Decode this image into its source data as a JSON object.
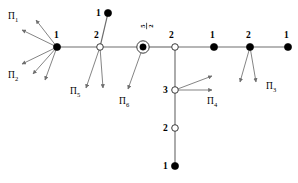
{
  "figure": {
    "type": "graph-diagram",
    "background_color": "#ffffff",
    "edge_color": "#6e6e6e",
    "node_fill_color": "#000000",
    "node_open_color": "#ffffff",
    "label_color": "#000000"
  },
  "nodes": [
    {
      "id": "n1",
      "label": "1",
      "x": 57,
      "y": 47,
      "style": "filled",
      "label_x": 54,
      "label_y": 38
    },
    {
      "id": "n2",
      "label": "2",
      "x": 100,
      "y": 47,
      "style": "open",
      "label_x": 94,
      "label_y": 38
    },
    {
      "id": "n3",
      "label": "1",
      "x": 108,
      "y": 13,
      "style": "filled",
      "label_x": 96,
      "label_y": 16
    },
    {
      "id": "n4",
      "label": "5/2",
      "x": 143,
      "y": 47,
      "style": "double-ring",
      "label_x": 146,
      "label_y": 26
    },
    {
      "id": "n5",
      "label": "2",
      "x": 175,
      "y": 47,
      "style": "open",
      "label_x": 169,
      "label_y": 38
    },
    {
      "id": "n6",
      "label": "1",
      "x": 214,
      "y": 47,
      "style": "filled",
      "label_x": 210,
      "label_y": 38
    },
    {
      "id": "n7",
      "label": "2",
      "x": 250,
      "y": 47,
      "style": "filled",
      "label_x": 246,
      "label_y": 38
    },
    {
      "id": "n8",
      "label": "1",
      "x": 288,
      "y": 47,
      "style": "filled",
      "label_x": 284,
      "label_y": 38
    },
    {
      "id": "n9",
      "label": "3",
      "x": 175,
      "y": 90,
      "style": "open",
      "label_x": 163,
      "label_y": 93
    },
    {
      "id": "n10",
      "label": "2",
      "x": 175,
      "y": 128,
      "style": "open",
      "label_x": 163,
      "label_y": 131
    },
    {
      "id": "n11",
      "label": "1",
      "x": 175,
      "y": 166,
      "style": "filled",
      "label_x": 163,
      "label_y": 169
    }
  ],
  "edges": [
    {
      "from": "n1",
      "to": "n2"
    },
    {
      "from": "n2",
      "to": "n3"
    },
    {
      "from": "n2",
      "to": "n4"
    },
    {
      "from": "n4",
      "to": "n5"
    },
    {
      "from": "n5",
      "to": "n6"
    },
    {
      "from": "n6",
      "to": "n7"
    },
    {
      "from": "n7",
      "to": "n8"
    },
    {
      "from": "n5",
      "to": "n9"
    },
    {
      "from": "n9",
      "to": "n10"
    },
    {
      "from": "n10",
      "to": "n11"
    }
  ],
  "arrow_bundles": [
    {
      "id": "pi1",
      "label": "Π",
      "subscript": "1",
      "label_x": 8,
      "label_y": 19,
      "origin_x": 57,
      "origin_y": 47,
      "arrows": [
        {
          "x2": 36,
          "y2": 20
        },
        {
          "x2": 22,
          "y2": 30
        }
      ]
    },
    {
      "id": "pi2",
      "label": "Π",
      "subscript": "2",
      "label_x": 8,
      "label_y": 78,
      "origin_x": 57,
      "origin_y": 47,
      "arrows": [
        {
          "x2": 22,
          "y2": 64
        },
        {
          "x2": 33,
          "y2": 74
        },
        {
          "x2": 45,
          "y2": 80
        }
      ]
    },
    {
      "id": "pi5",
      "label": "Π",
      "subscript": "5",
      "label_x": 70,
      "label_y": 94,
      "origin_x": 100,
      "origin_y": 47,
      "arrows": [
        {
          "x2": 86,
          "y2": 88
        },
        {
          "x2": 103,
          "y2": 88
        }
      ]
    },
    {
      "id": "pi6",
      "label": "Π",
      "subscript": "6",
      "label_x": 119,
      "label_y": 104,
      "origin_x": 143,
      "origin_y": 47,
      "arrows": [
        {
          "x2": 128,
          "y2": 89
        }
      ]
    },
    {
      "id": "pi4",
      "label": "Π",
      "subscript": "4",
      "label_x": 207,
      "label_y": 104,
      "origin_x": 175,
      "origin_y": 90,
      "arrows": [
        {
          "x2": 212,
          "y2": 76
        },
        {
          "x2": 212,
          "y2": 90
        }
      ]
    },
    {
      "id": "pi3",
      "label": "Π",
      "subscript": "3",
      "label_x": 266,
      "label_y": 89,
      "origin_x": 250,
      "origin_y": 47,
      "arrows": [
        {
          "x2": 240,
          "y2": 82
        },
        {
          "x2": 256,
          "y2": 82
        }
      ]
    }
  ],
  "fraction_label": {
    "numerator": "5",
    "denominator": "2",
    "x": 146,
    "y": 26,
    "rotation": -90
  }
}
